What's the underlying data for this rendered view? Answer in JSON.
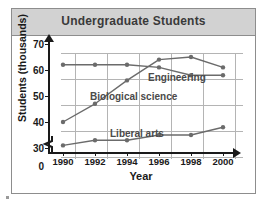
{
  "card": {
    "title": "Undergraduate Students"
  },
  "chart_data": {
    "type": "line",
    "title": "Undergraduate Students",
    "xlabel": "Year",
    "ylabel": "Students (thousands)",
    "categories": [
      "1990",
      "1992",
      "1994",
      "1996",
      "1998",
      "2000"
    ],
    "x": [
      1990,
      1992,
      1994,
      1996,
      1998,
      2000
    ],
    "xlim": [
      1989,
      2001
    ],
    "ylim": [
      30,
      70
    ],
    "ytick_labels": [
      "0",
      "30",
      "40",
      "50",
      "60",
      "70"
    ],
    "yticks": [
      0,
      30,
      40,
      50,
      60,
      70
    ],
    "axis_break": "between 0 and 30",
    "grid": true,
    "legend": "inline-labels",
    "series": [
      {
        "name": "Engineering",
        "values": [
          62,
          62,
          62,
          61,
          58,
          58
        ],
        "color": "#6b6b6b",
        "label_x": 148,
        "label_y": 72
      },
      {
        "name": "Biological science",
        "values": [
          40,
          47,
          56,
          64,
          65,
          61
        ],
        "color": "#6b6b6b",
        "label_x": 90,
        "label_y": 91
      },
      {
        "name": "Liberal arts",
        "values": [
          31,
          33,
          33,
          35,
          35,
          38
        ],
        "color": "#6b6b6b",
        "label_x": 110,
        "label_y": 128
      }
    ]
  },
  "axis": {
    "ytick_0": "0",
    "ytick_30": "30",
    "ytick_40": "40",
    "ytick_50": "50",
    "ytick_60": "60",
    "ytick_70": "70",
    "xtick_1990": "1990",
    "xtick_1992": "1992",
    "xtick_1994": "1994",
    "xtick_1996": "1996",
    "xtick_1998": "1998",
    "xtick_2000": "2000",
    "ylabel": "Students (thousands)",
    "xlabel": "Year"
  },
  "series_labels": {
    "engineering": "Engineering",
    "biological": "Biological science",
    "liberal": "Liberal arts"
  },
  "colors": {
    "line": "#6b6b6b",
    "grid": "#b4b4b4",
    "axis": "#1a1a1a",
    "title_band": "#d2d2d2",
    "frame": "#8d8d8d"
  }
}
